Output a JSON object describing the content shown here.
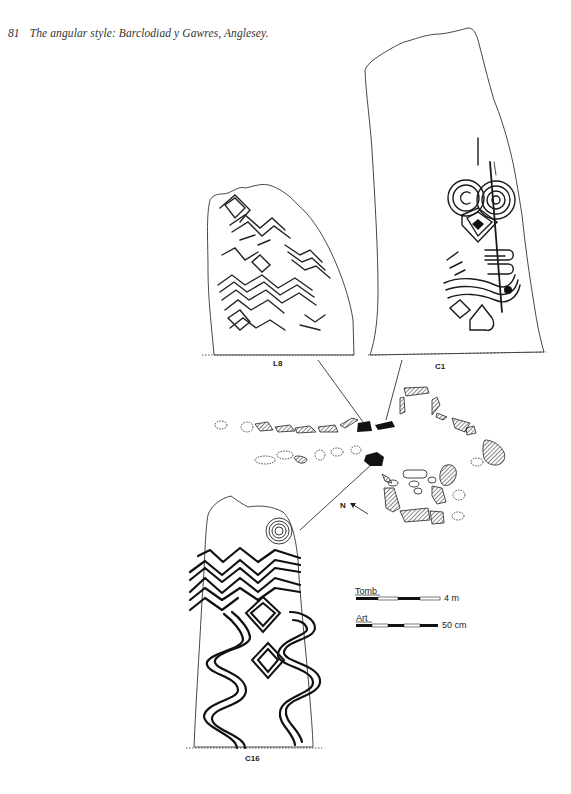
{
  "caption": {
    "number": "81",
    "text": "The angular style: Barclodiad y Gawres, Anglesey."
  },
  "figure": {
    "stones": [
      {
        "id": "L8",
        "label": "L8"
      },
      {
        "id": "C1",
        "label": "C1"
      },
      {
        "id": "C16",
        "label": "C16"
      }
    ],
    "north_label": "N",
    "scales": [
      {
        "name": "Tomb",
        "value": "4 m"
      },
      {
        "name": "Art",
        "value": "50 cm"
      }
    ]
  },
  "colors": {
    "ink": "#1a1a1a",
    "paper": "#ffffff",
    "caption": "#333333"
  }
}
